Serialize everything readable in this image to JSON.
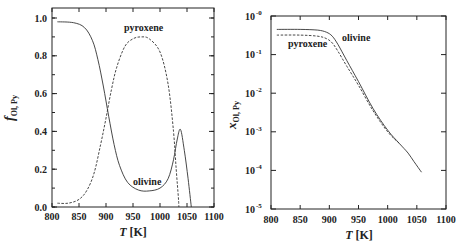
{
  "chart_data": [
    {
      "type": "line",
      "panel": "left",
      "title": "",
      "xlabel": "T [K]",
      "ylabel": "f_Ol, Py",
      "xlim": [
        800,
        1100
      ],
      "ylim": [
        0.0,
        1.0
      ],
      "x_ticks": [
        "800",
        "850",
        "900",
        "950",
        "1000",
        "1050",
        "1100"
      ],
      "y_ticks": [
        "0.0",
        "0.2",
        "0.4",
        "0.6",
        "0.8",
        "1.0"
      ],
      "grid": false,
      "series": [
        {
          "name": "olivine",
          "style": "solid",
          "x": [
            810,
            840,
            860,
            875,
            885,
            895,
            905,
            915,
            925,
            940,
            960,
            980,
            1000,
            1015,
            1025,
            1032,
            1038,
            1045,
            1052,
            1058
          ],
          "values": [
            0.98,
            0.975,
            0.95,
            0.88,
            0.78,
            0.64,
            0.48,
            0.33,
            0.22,
            0.13,
            0.09,
            0.085,
            0.1,
            0.15,
            0.25,
            0.36,
            0.41,
            0.3,
            0.15,
            0.0
          ]
        },
        {
          "name": "pyroxene",
          "style": "dashed",
          "x": [
            810,
            830,
            850,
            865,
            878,
            890,
            900,
            910,
            920,
            935,
            950,
            965,
            980,
            1000,
            1015,
            1025,
            1030,
            1034,
            1035
          ],
          "values": [
            0.02,
            0.02,
            0.04,
            0.09,
            0.18,
            0.33,
            0.47,
            0.62,
            0.74,
            0.85,
            0.89,
            0.9,
            0.89,
            0.82,
            0.65,
            0.4,
            0.2,
            0.05,
            0.0
          ]
        }
      ],
      "annotations": [
        {
          "text": "pyroxene",
          "x": 975,
          "y": 0.93
        },
        {
          "text": "olivine",
          "x": 990,
          "y": 0.14
        }
      ]
    },
    {
      "type": "line",
      "panel": "right",
      "title": "",
      "xlabel": "T [K]",
      "ylabel": "x_Ol, Py",
      "yscale": "log",
      "xlim": [
        800,
        1100
      ],
      "ylim": [
        1e-05,
        1
      ],
      "x_ticks": [
        "800",
        "850",
        "900",
        "950",
        "1000",
        "1050",
        "1100"
      ],
      "y_ticks": [
        "10^-5",
        "10^-4",
        "10^-3",
        "10^-2",
        "10^-1",
        "10^-0"
      ],
      "grid": false,
      "series": [
        {
          "name": "olivine",
          "style": "solid",
          "x": [
            810,
            850,
            880,
            895,
            905,
            915,
            930,
            950,
            975,
            1000,
            1020,
            1035,
            1045,
            1058
          ],
          "values": [
            0.45,
            0.45,
            0.43,
            0.38,
            0.3,
            0.18,
            0.07,
            0.02,
            0.004,
            0.0011,
            0.0005,
            0.00028,
            0.00017,
            9e-05
          ]
        },
        {
          "name": "pyroxene",
          "style": "dashed",
          "x": [
            810,
            850,
            880,
            895,
            905,
            915,
            930,
            950,
            975,
            1000,
            1020
          ],
          "values": [
            0.32,
            0.32,
            0.3,
            0.26,
            0.2,
            0.12,
            0.05,
            0.016,
            0.0035,
            0.001,
            0.0005
          ]
        }
      ],
      "annotations": [
        {
          "text": "olivine",
          "x": 935,
          "y": 0.28
        },
        {
          "text": "pyroxene",
          "x": 858,
          "y": 0.16
        }
      ]
    }
  ],
  "left": {
    "ylabel_main": "f",
    "ylabel_sub": "Ol, Py",
    "xlabel_italic": "T",
    "xlabel_unit": " [K]",
    "label_pyroxene": "pyroxene",
    "label_olivine": "olivine"
  },
  "right": {
    "ylabel_main": "x",
    "ylabel_sub": "Ol, Py",
    "xlabel_italic": "T",
    "xlabel_unit": " [K]",
    "label_pyroxene": "pyroxene",
    "label_olivine": "olivine",
    "ytick_base": "10",
    "ytick_exps": [
      "-0",
      "-1",
      "-2",
      "-3",
      "-4",
      "-5"
    ]
  },
  "colors": {
    "line": "#333333",
    "axis": "#222222",
    "background": "#ffffff"
  }
}
